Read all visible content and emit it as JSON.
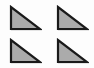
{
  "figure": {
    "background_color": "#fdfdfd",
    "width": 94,
    "height": 68,
    "shape_count": 4,
    "grid": {
      "rows": 2,
      "columns": 2
    }
  },
  "style": {
    "fill_color": "#ababab",
    "stroke_color": "#1a1a1a",
    "stroke_width": 2.2,
    "shadow_color": "#e4e4e4",
    "shadow_offset_x": 1,
    "shadow_offset_y": 1
  },
  "shapes": [
    {
      "name": "right-triangle-top-left",
      "type": "triangle",
      "subtype": "right-triangle",
      "right_angle_corner": "bottom-left",
      "hypotenuse": "top-left to bottom-right",
      "x": 9,
      "y": 5,
      "width": 33,
      "height": 26,
      "fill": "#ababab",
      "stroke": "#1a1a1a",
      "points": "2,2 2,24 31,24"
    },
    {
      "name": "right-triangle-top-right",
      "type": "triangle",
      "subtype": "right-triangle",
      "right_angle_corner": "bottom-left",
      "hypotenuse": "top-left to bottom-right",
      "x": 56,
      "y": 5,
      "width": 33,
      "height": 26,
      "fill": "#ababab",
      "stroke": "#1a1a1a",
      "points": "2,2 2,24 31,24"
    },
    {
      "name": "right-triangle-bottom-left",
      "type": "triangle",
      "subtype": "right-triangle",
      "right_angle_corner": "bottom-left",
      "hypotenuse": "top-left to bottom-right",
      "x": 9,
      "y": 38,
      "width": 33,
      "height": 26,
      "fill": "#ababab",
      "stroke": "#1a1a1a",
      "points": "2,2 2,24 31,24"
    },
    {
      "name": "right-triangle-bottom-right",
      "type": "triangle",
      "subtype": "right-triangle",
      "right_angle_corner": "bottom-left",
      "hypotenuse": "top-left to bottom-right",
      "x": 56,
      "y": 38,
      "width": 33,
      "height": 26,
      "fill": "#ababab",
      "stroke": "#1a1a1a",
      "points": "2,2 2,24 31,24"
    }
  ]
}
